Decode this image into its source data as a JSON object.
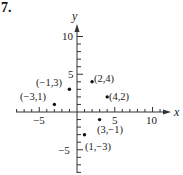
{
  "problem_number": "7.",
  "chart_data": {
    "type": "scatter",
    "title": "",
    "xlabel": "x",
    "ylabel": "y",
    "xlim": [
      -8,
      12
    ],
    "ylim": [
      -8,
      11
    ],
    "x_ticks_labeled": [
      -5,
      5,
      10
    ],
    "y_ticks_labeled": [
      -5,
      5,
      10
    ],
    "grid": false,
    "legend": null,
    "points": [
      {
        "x": -3,
        "y": 1,
        "label": "(-3,1)"
      },
      {
        "x": -1,
        "y": 3,
        "label": "(-1,3)"
      },
      {
        "x": 2,
        "y": 4,
        "label": "(2,4)"
      },
      {
        "x": 4,
        "y": 2,
        "label": "(4,2)"
      },
      {
        "x": 3,
        "y": -1,
        "label": "(3,−1)"
      },
      {
        "x": 1,
        "y": -3,
        "label": "(1,−3)"
      }
    ]
  },
  "labels": {
    "x_axis": "x",
    "y_axis": "y",
    "tick_neg5": "−5",
    "tick_5": "5",
    "tick_10": "10",
    "ytick_10": "10",
    "ytick_5": "5",
    "ytick_neg5": "−5",
    "p1": "(−3,1)",
    "p2": "(−1,3)",
    "p3": "(2,4)",
    "p4": "(4,2)",
    "p5": "(3,−1)",
    "p6": "(1,−3)"
  }
}
